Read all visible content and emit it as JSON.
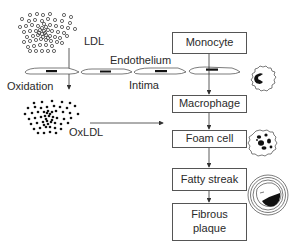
{
  "diagram": {
    "labels": {
      "ldl": "LDL",
      "endothelium": "Endothelium",
      "oxidation": "Oxidation",
      "intima": "Intima",
      "oxldl": "OxLDL"
    },
    "boxes": [
      {
        "id": "monocyte",
        "label": "Monocyte"
      },
      {
        "id": "macrophage",
        "label": "Macrophage"
      },
      {
        "id": "foam-cell",
        "label": "Foam cell"
      },
      {
        "id": "fatty-streak",
        "label": "Fatty streak"
      },
      {
        "id": "fibrous-plaque",
        "label": "Fibrous plaque",
        "line1": "Fibrous",
        "line2": "plaque"
      }
    ],
    "icons": {
      "monocyte_cell": "monocyte-cell-icon",
      "foam_cell": "foam-cell-icon",
      "artery_plaque": "artery-cross-section-icon",
      "ldl_particles": "ldl-particle-cluster-icon",
      "oxldl_particles": "oxldl-particle-cluster-icon",
      "endothelial_cells": "endothelial-cell-layer-icon"
    },
    "edges": [
      {
        "from": "LDL",
        "to": "OxLDL",
        "via": "Oxidation"
      },
      {
        "from": "OxLDL",
        "to": "Macrophage"
      },
      {
        "from": "Monocyte",
        "to": "Macrophage"
      },
      {
        "from": "Macrophage",
        "to": "Foam cell"
      },
      {
        "from": "Foam cell",
        "to": "Fatty streak"
      },
      {
        "from": "Fatty streak",
        "to": "Fibrous plaque"
      }
    ],
    "colors": {
      "line": "#444444",
      "fill_dark": "#111111",
      "box_border": "#555555"
    }
  }
}
